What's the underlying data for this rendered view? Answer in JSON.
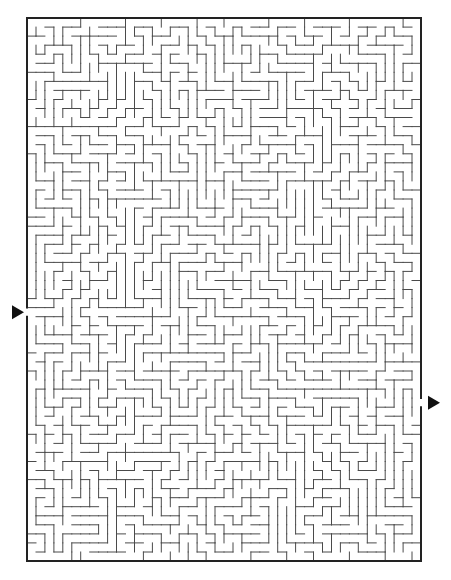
{
  "maze": {
    "frame": {
      "left": 27,
      "top": 18,
      "right": 421,
      "bottom": 561
    },
    "cols": 44,
    "rows": 60,
    "cell": 9,
    "wall_color": "#4a4a4a",
    "border_color": "#222222",
    "seed": 7331,
    "entrance": {
      "side": "left",
      "row": 32,
      "arrow_icon": "right-pointing-triangle"
    },
    "exit": {
      "side": "right",
      "row": 42,
      "arrow_icon": "right-pointing-triangle"
    }
  }
}
